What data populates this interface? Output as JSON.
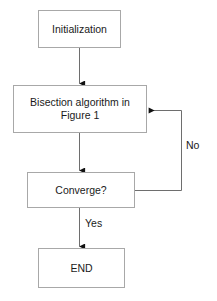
{
  "diagram": {
    "type": "flowchart",
    "title": "",
    "nodes": [
      {
        "id": "initialization",
        "label": "Initialization",
        "shape": "rectangle"
      },
      {
        "id": "bisection",
        "label": "Bisection algorithm in\nFigure 1",
        "shape": "rectangle"
      },
      {
        "id": "converge",
        "label": "Converge?",
        "shape": "rectangle"
      },
      {
        "id": "end",
        "label": "END",
        "shape": "rectangle"
      }
    ],
    "edges": [
      {
        "from": "initialization",
        "to": "bisection",
        "label": "",
        "arrow": "down"
      },
      {
        "from": "bisection",
        "to": "converge",
        "label": "",
        "arrow": "down"
      },
      {
        "from": "converge",
        "to": "end",
        "label": "Yes",
        "arrow": "down"
      },
      {
        "from": "converge",
        "to": "bisection",
        "label": "No",
        "arrow": "feedback-right-up-left"
      }
    ],
    "labels": {
      "no": "No",
      "yes": "Yes"
    },
    "colors": {
      "background": "#ffffff",
      "node_border": "#a8a8a8",
      "node_fill": "#ffffff",
      "text": "#1a1a1a",
      "connector": "#6e6e6e",
      "arrowhead": "#111111"
    }
  }
}
